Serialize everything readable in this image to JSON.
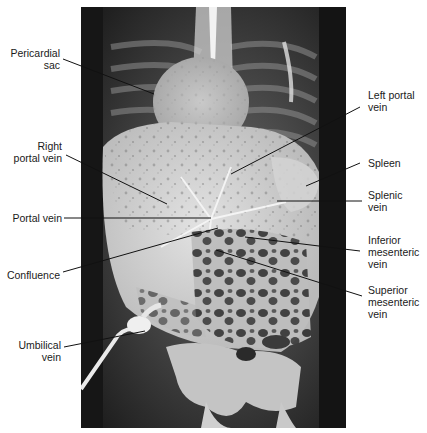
{
  "figure": {
    "type": "annotated radiograph (portal venogram via umbilical vein)",
    "background_color": "#ffffff",
    "line_color": "#111111",
    "labels_left": [
      {
        "id": "pericardial-sac",
        "text": "Pericardial\nsac"
      },
      {
        "id": "right-portal-vein",
        "text": "Right\nportal vein"
      },
      {
        "id": "portal-vein",
        "text": "Portal vein"
      },
      {
        "id": "confluence",
        "text": "Confluence"
      },
      {
        "id": "umbilical-vein",
        "text": "Umbilical\nvein"
      }
    ],
    "labels_right": [
      {
        "id": "left-portal-vein",
        "text": "Left portal\nvein"
      },
      {
        "id": "spleen",
        "text": "Spleen"
      },
      {
        "id": "splenic-vein",
        "text": "Splenic\nvein"
      },
      {
        "id": "inferior-mesenteric-vein",
        "text": "Inferior\nmesenteric\nvein"
      },
      {
        "id": "superior-mesenteric-vein",
        "text": "Superior\nmesenteric\nvein"
      }
    ]
  }
}
